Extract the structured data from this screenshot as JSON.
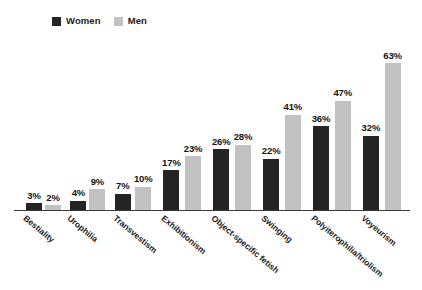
{
  "legend": {
    "position": "top-left",
    "entries": [
      {
        "label": "Women",
        "color": "#242424",
        "swatch_icon": "square-icon"
      },
      {
        "label": "Men",
        "color": "#c2c2c2",
        "swatch_icon": "square-icon"
      }
    ]
  },
  "chart_data": {
    "type": "bar",
    "title": "",
    "subtitle": "",
    "xlabel": "",
    "ylabel": "",
    "ylim": [
      0,
      70
    ],
    "grid": false,
    "legend_position": "top-left",
    "value_suffix": "%",
    "categories": [
      "Bestiality",
      "Urophilia",
      "Transvestism",
      "Exhibitionism",
      "Object-specific fetish",
      "Swinging",
      "Polyiterophilia/triolism",
      "Voyeurism"
    ],
    "series": [
      {
        "name": "Women",
        "color": "#242424",
        "values": [
          3,
          4,
          7,
          17,
          26,
          22,
          36,
          32
        ],
        "labels": [
          "3%",
          "4%",
          "7%",
          "17%",
          "26%",
          "22%",
          "36%",
          "32%"
        ]
      },
      {
        "name": "Men",
        "color": "#c2c2c2",
        "values": [
          2,
          9,
          10,
          23,
          28,
          41,
          47,
          63
        ],
        "labels": [
          "2%",
          "9%",
          "10%",
          "23%",
          "28%",
          "41%",
          "47%",
          "63%"
        ]
      }
    ]
  }
}
